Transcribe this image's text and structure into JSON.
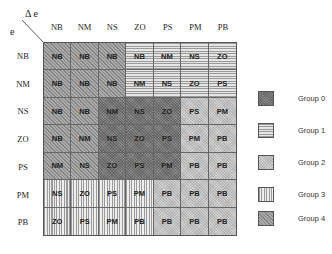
{
  "axes": {
    "column_axis_label": "Δ e",
    "row_axis_label": "e"
  },
  "columns": [
    "NB",
    "NM",
    "NS",
    "ZO",
    "PS",
    "PM",
    "PB"
  ],
  "rows": [
    {
      "label": "NB",
      "cells": [
        {
          "value": "NB",
          "group": 4
        },
        {
          "value": "NB",
          "group": 4
        },
        {
          "value": "NB",
          "group": 4
        },
        {
          "value": "NB",
          "group": 1
        },
        {
          "value": "NM",
          "group": 1
        },
        {
          "value": "NS",
          "group": 1
        },
        {
          "value": "ZO",
          "group": 1
        }
      ]
    },
    {
      "label": "NM",
      "cells": [
        {
          "value": "NB",
          "group": 4
        },
        {
          "value": "NB",
          "group": 4
        },
        {
          "value": "NB",
          "group": 4
        },
        {
          "value": "NM",
          "group": 1
        },
        {
          "value": "NS",
          "group": 1
        },
        {
          "value": "ZO",
          "group": 1
        },
        {
          "value": "PS",
          "group": 1
        }
      ]
    },
    {
      "label": "NS",
      "cells": [
        {
          "value": "NB",
          "group": 4
        },
        {
          "value": "NB",
          "group": 4
        },
        {
          "value": "NM",
          "group": 0
        },
        {
          "value": "NS",
          "group": 0
        },
        {
          "value": "ZO",
          "group": 0
        },
        {
          "value": "PS",
          "group": 2
        },
        {
          "value": "PM",
          "group": 2
        }
      ]
    },
    {
      "label": "ZO",
      "cells": [
        {
          "value": "NB",
          "group": 4
        },
        {
          "value": "NM",
          "group": 4
        },
        {
          "value": "NS",
          "group": 0
        },
        {
          "value": "ZO",
          "group": 0
        },
        {
          "value": "PS",
          "group": 0
        },
        {
          "value": "PM",
          "group": 2
        },
        {
          "value": "PB",
          "group": 2
        }
      ]
    },
    {
      "label": "PS",
      "cells": [
        {
          "value": "NM",
          "group": 4
        },
        {
          "value": "NS",
          "group": 4
        },
        {
          "value": "ZO",
          "group": 0
        },
        {
          "value": "PS",
          "group": 0
        },
        {
          "value": "PM",
          "group": 0
        },
        {
          "value": "PB",
          "group": 2
        },
        {
          "value": "PB",
          "group": 2
        }
      ]
    },
    {
      "label": "PM",
      "cells": [
        {
          "value": "NS",
          "group": 3
        },
        {
          "value": "ZO",
          "group": 3
        },
        {
          "value": "PS",
          "group": 3
        },
        {
          "value": "PM",
          "group": 3
        },
        {
          "value": "PB",
          "group": 2
        },
        {
          "value": "PB",
          "group": 2
        },
        {
          "value": "PB",
          "group": 2
        }
      ]
    },
    {
      "label": "PB",
      "cells": [
        {
          "value": "ZO",
          "group": 3
        },
        {
          "value": "PS",
          "group": 3
        },
        {
          "value": "PM",
          "group": 3
        },
        {
          "value": "PB",
          "group": 3
        },
        {
          "value": "PB",
          "group": 2
        },
        {
          "value": "PB",
          "group": 2
        },
        {
          "value": "PB",
          "group": 2
        }
      ]
    }
  ],
  "legend": [
    {
      "label": "Group 0",
      "pattern": "dark-crosshatch"
    },
    {
      "label": "Group 1",
      "pattern": "horizontal-lines"
    },
    {
      "label": "Group 2",
      "pattern": "light-crosshatch"
    },
    {
      "label": "Group 3",
      "pattern": "vertical-lines"
    },
    {
      "label": "Group 4",
      "pattern": "diagonal-lines"
    }
  ]
}
